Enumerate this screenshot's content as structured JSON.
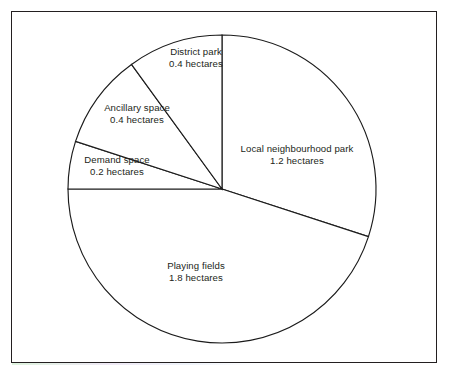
{
  "chart_data": {
    "type": "pie",
    "title": "",
    "subtitle": "",
    "xlabel": "",
    "ylabel": "",
    "unit": "hectares",
    "total": 4.0,
    "legend_position": "none",
    "grid": false,
    "start_angle_deg": 0,
    "direction": "clockwise",
    "categories": [
      "Local neighbourhood park",
      "Playing fields",
      "Demand space",
      "Ancillary space",
      "District park"
    ],
    "values": [
      1.2,
      1.8,
      0.2,
      0.4,
      0.4
    ],
    "slices": [
      {
        "name": "Local neighbourhood park",
        "value": 1.2,
        "value_text": "1.2 hectares",
        "angle_deg": 108,
        "start_deg": 0,
        "end_deg": 108,
        "label_x": 297,
        "label_y": 155
      },
      {
        "name": "Playing fields",
        "value": 1.8,
        "value_text": "1.8 hectares",
        "angle_deg": 162,
        "start_deg": 108,
        "end_deg": 270,
        "label_x": 196,
        "label_y": 272
      },
      {
        "name": "Demand space",
        "value": 0.2,
        "value_text": "0.2 hectares",
        "angle_deg": 18,
        "start_deg": 270,
        "end_deg": 288,
        "label_x": 117,
        "label_y": 166
      },
      {
        "name": "Ancillary space",
        "value": 0.4,
        "value_text": "0.4 hectares",
        "angle_deg": 36,
        "start_deg": 288,
        "end_deg": 324,
        "label_x": 137,
        "label_y": 114
      },
      {
        "name": "District park",
        "value": 0.4,
        "value_text": "0.4 hectares",
        "angle_deg": 36,
        "start_deg": 324,
        "end_deg": 360,
        "label_x": 196,
        "label_y": 58
      }
    ],
    "geometry": {
      "center_x": 222,
      "center_y": 189,
      "radius": 154
    },
    "colors": {
      "slice_fill": "#ffffff",
      "slice_stroke": "#1b1b1b",
      "label_text": "#231f20",
      "frame_border": "#231f20",
      "background": "#ffffff"
    }
  }
}
